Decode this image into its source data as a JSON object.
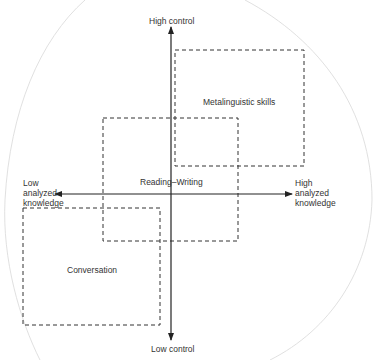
{
  "axes": {
    "top_label": "High control",
    "bottom_label": "Low control",
    "left_label": [
      "Low",
      "analyzed",
      "knowledge"
    ],
    "right_label": [
      "High",
      "analyzed",
      "knowledge"
    ]
  },
  "regions": [
    {
      "id": "metalinguistic",
      "label": "Metalinguistic skills"
    },
    {
      "id": "reading-writing",
      "label": "Reading–Writing"
    },
    {
      "id": "conversation",
      "label": "Conversation"
    }
  ],
  "colors": {
    "line": "#222222",
    "outline": "#d0d0d0"
  }
}
